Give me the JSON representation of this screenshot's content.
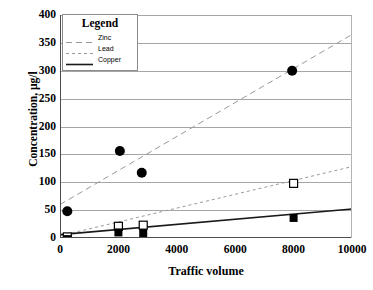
{
  "chart_data": {
    "type": "scatter",
    "title": "",
    "xlabel": "Traffic volume",
    "ylabel": "Concentration, µg/l",
    "xlim": [
      0,
      10000
    ],
    "ylim": [
      0,
      400
    ],
    "xticks": [
      0,
      2000,
      4000,
      6000,
      8000,
      10000
    ],
    "xticklabels": [
      "0",
      "2000",
      "4000",
      "6000",
      "8000",
      "10000"
    ],
    "yticks": [
      0,
      50,
      100,
      150,
      200,
      250,
      300,
      350,
      400
    ],
    "yticklabels": [
      "0",
      "50",
      "100",
      "150",
      "200",
      "250",
      "300",
      "350",
      "400"
    ],
    "grid": "horizontal",
    "legend": {
      "title": "Legend",
      "position": "top-left-inside",
      "entries": [
        {
          "label": "Zinc",
          "style": "long-dashed",
          "color": "#999999"
        },
        {
          "label": "Lead",
          "style": "short-dashed",
          "color": "#999999"
        },
        {
          "label": "Copper",
          "style": "solid",
          "color": "#1a1a1a"
        }
      ]
    },
    "series": [
      {
        "name": "Zinc",
        "marker": "filled-circle",
        "color": "#000000",
        "points": [
          {
            "x": 250,
            "y": 48
          },
          {
            "x": 2050,
            "y": 156
          },
          {
            "x": 2800,
            "y": 117
          },
          {
            "x": 7950,
            "y": 300
          }
        ],
        "trendline": {
          "style": "long-dashed",
          "color": "#999999",
          "x": [
            0,
            10000
          ],
          "y": [
            60,
            365
          ]
        }
      },
      {
        "name": "Lead",
        "marker": "open-square",
        "color": "#000000",
        "points": [
          {
            "x": 250,
            "y": 2
          },
          {
            "x": 2000,
            "y": 21
          },
          {
            "x": 2850,
            "y": 23
          },
          {
            "x": 8000,
            "y": 98
          }
        ],
        "trendline": {
          "style": "short-dashed",
          "color": "#999999",
          "x": [
            0,
            10000
          ],
          "y": [
            4,
            128
          ]
        }
      },
      {
        "name": "Copper",
        "marker": "filled-square",
        "color": "#000000",
        "points": [
          {
            "x": 250,
            "y": -2
          },
          {
            "x": 2000,
            "y": 10
          },
          {
            "x": 2850,
            "y": 9
          },
          {
            "x": 8000,
            "y": 36
          }
        ],
        "trendline": {
          "style": "solid",
          "color": "#1a1a1a",
          "x": [
            0,
            10000
          ],
          "y": [
            6,
            52
          ]
        }
      }
    ]
  }
}
